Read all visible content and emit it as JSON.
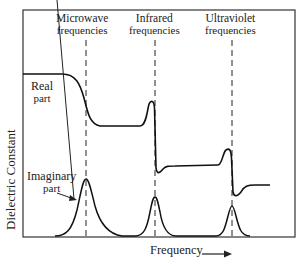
{
  "figure": {
    "y_axis_label": "Dielectric Constant",
    "x_axis_label": "Frequency",
    "x_axis_arrow": "→",
    "regions": [
      {
        "line1": "Microwave",
        "line2": "frequencies"
      },
      {
        "line1": "Infrared",
        "line2": "frequencies"
      },
      {
        "line1": "Ultraviolet",
        "line2": "frequencies"
      }
    ],
    "curves": {
      "real": {
        "line1": "Real",
        "line2": "part"
      },
      "imaginary": {
        "line1": "Imaginary",
        "line2": "part"
      }
    },
    "colors": {
      "line": "#1a1a1a",
      "background": "#ffffff"
    }
  }
}
